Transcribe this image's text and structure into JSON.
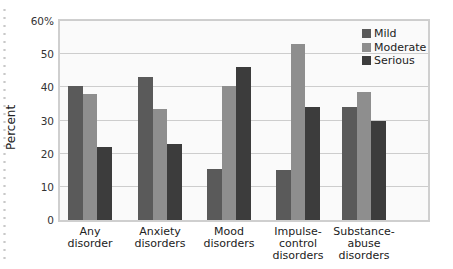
{
  "chart_data": {
    "type": "bar",
    "title": "",
    "xlabel": "",
    "ylabel": "Percent",
    "ylim": [
      0,
      60
    ],
    "yticks": [
      "0",
      "10",
      "20",
      "30",
      "40",
      "50",
      "60%"
    ],
    "grid": true,
    "legend_position": "top-right inside",
    "categories": [
      "Any disorder",
      "Anxiety disorders",
      "Mood disorders",
      "Impulse-control disorders",
      "Substance-abuse disorders"
    ],
    "category_labels": [
      [
        "Any",
        "disorder"
      ],
      [
        "Anxiety",
        "disorders"
      ],
      [
        "Mood",
        "disorders"
      ],
      [
        "Impulse-",
        "control",
        "disorders"
      ],
      [
        "Substance-",
        "abuse",
        "disorders"
      ]
    ],
    "series": [
      {
        "name": "Mild",
        "color": "#5a5a5a",
        "values": [
          40.5,
          43,
          15.5,
          15,
          34
        ]
      },
      {
        "name": "Moderate",
        "color": "#8e8e8e",
        "values": [
          38,
          33.5,
          40.5,
          53,
          38.5
        ]
      },
      {
        "name": "Serious",
        "color": "#3c3c3c",
        "values": [
          22,
          23,
          46,
          34,
          30
        ]
      }
    ]
  }
}
